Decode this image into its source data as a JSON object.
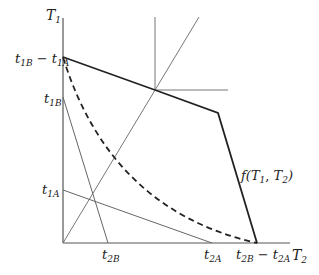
{
  "diagram": {
    "axes": {
      "y_label": "T",
      "y_label_sub": "1",
      "x_label": "T",
      "x_label_sub": "2"
    },
    "y_ticks": [
      {
        "main": "t",
        "sub1": "1B",
        "minus": " − ",
        "main2": "t",
        "sub2": "1A"
      },
      {
        "main": "t",
        "sub1": "1B"
      },
      {
        "main": "t",
        "sub1": "1A"
      }
    ],
    "x_ticks": [
      {
        "main": "t",
        "sub1": "2B"
      },
      {
        "main": "t",
        "sub1": "2A"
      },
      {
        "main": "t",
        "sub1": "2B",
        "minus": " − ",
        "main2": "t",
        "sub2": "2A"
      }
    ],
    "curve_label": {
      "prefix": "f(",
      "t1": "T",
      "t1_sub": "1",
      "comma": ", ",
      "t2": "T",
      "t2_sub": "2",
      "suffix": ")"
    },
    "colors": {
      "axis": "#555555",
      "thin_line": "#666666",
      "frontier": "#222222"
    }
  }
}
